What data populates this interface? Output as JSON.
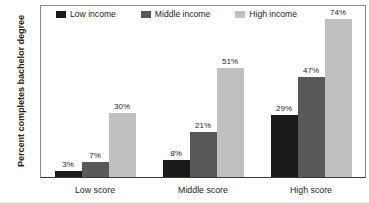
{
  "chart_data": {
    "type": "bar",
    "title": "",
    "xlabel": "",
    "ylabel": "Percent completes bachelor degree",
    "categories": [
      "Low score",
      "Middle score",
      "High score"
    ],
    "series": [
      {
        "name": "Low income",
        "color": "#1a1a1a",
        "values": [
          3,
          8,
          29
        ],
        "labels": [
          "3%",
          "8%",
          "29%"
        ]
      },
      {
        "name": "Middle income",
        "color": "#585858",
        "values": [
          7,
          21,
          47
        ],
        "labels": [
          "7%",
          "21%",
          "47%"
        ]
      },
      {
        "name": "High income",
        "color": "#c0c0c0",
        "values": [
          30,
          51,
          74
        ],
        "labels": [
          "30%",
          "51%",
          "74%"
        ]
      }
    ],
    "ylim": [
      0,
      80
    ],
    "yticks": [
      0,
      10,
      20,
      30,
      40,
      50,
      60,
      70,
      80
    ],
    "ytick_labels": [
      "0",
      "10",
      "20",
      "30",
      "40",
      "50",
      "60",
      "70",
      "80"
    ],
    "grid": false,
    "legend_position": "top-left-inside"
  },
  "colors": {
    "axis": "#8a8a8a",
    "baseline": "#3a3a3a",
    "text": "#231f20",
    "background": "#ffffff"
  }
}
